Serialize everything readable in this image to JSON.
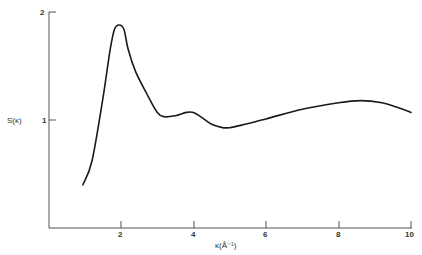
{
  "chart_data": {
    "type": "line",
    "title": "",
    "xlabel": "κ(Å⁻¹)",
    "ylabel": "S(κ)",
    "xlim": [
      0,
      10
    ],
    "ylim": [
      0,
      2
    ],
    "x_ticks": [
      2,
      4,
      6,
      8,
      10
    ],
    "x_tick_labels": [
      "2",
      "4",
      "6",
      "8",
      "10"
    ],
    "y_ticks": [
      1,
      2
    ],
    "y_tick_labels": [
      "1",
      "2"
    ],
    "grid": false,
    "legend": null,
    "series": [
      {
        "name": "S(κ)",
        "x": [
          0.95,
          1.2,
          1.5,
          1.7,
          1.82,
          1.95,
          2.08,
          2.2,
          2.4,
          2.7,
          3.0,
          3.2,
          3.5,
          3.8,
          4.0,
          4.2,
          4.5,
          4.8,
          5.0,
          5.3,
          6.0,
          7.0,
          8.0,
          8.6,
          9.2,
          9.6,
          10.0
        ],
        "values": [
          0.4,
          0.62,
          1.2,
          1.65,
          1.84,
          1.88,
          1.84,
          1.65,
          1.45,
          1.25,
          1.07,
          1.03,
          1.04,
          1.07,
          1.07,
          1.03,
          0.96,
          0.93,
          0.93,
          0.95,
          1.01,
          1.1,
          1.16,
          1.18,
          1.16,
          1.12,
          1.07
        ]
      }
    ]
  },
  "labels": {
    "xlabel": "κ(Å⁻¹)",
    "ylabel": "S(κ)",
    "y_tick_1": "1",
    "y_tick_2": "2",
    "x_tick_2": "2",
    "x_tick_4": "4",
    "x_tick_6": "6",
    "x_tick_8": "8",
    "x_tick_10": "10"
  },
  "colors": {
    "line": "#1a1a1a",
    "axis": "#555555"
  }
}
